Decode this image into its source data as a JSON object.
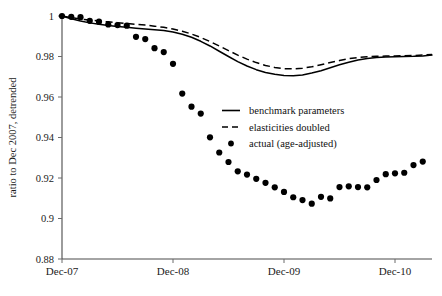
{
  "chart_data": {
    "type": "line",
    "title": "",
    "xlabel": "",
    "ylabel": "ratio to Dec 2007, detrended",
    "ylim": [
      0.88,
      1.0
    ],
    "xlim": [
      0,
      39
    ],
    "grid": false,
    "legend_position": "center-right",
    "y_ticks": [
      {
        "value": 1.0,
        "label": "1"
      },
      {
        "value": 0.98,
        "label": "0.98"
      },
      {
        "value": 0.96,
        "label": "0.96"
      },
      {
        "value": 0.94,
        "label": "0.94"
      },
      {
        "value": 0.92,
        "label": "0.92"
      },
      {
        "value": 0.9,
        "label": "0.9"
      },
      {
        "value": 0.88,
        "label": "0.88"
      }
    ],
    "x_ticks": [
      {
        "value": 0,
        "label": "Dec-07"
      },
      {
        "value": 12,
        "label": "Dec-08"
      },
      {
        "value": 24,
        "label": "Dec-09"
      },
      {
        "value": 36,
        "label": "Dec-10"
      }
    ],
    "series": [
      {
        "name": "benchmark parameters",
        "style": "solid",
        "x": [
          0,
          1,
          2,
          3,
          4,
          5,
          6,
          7,
          8,
          9,
          10,
          11,
          12,
          13,
          14,
          15,
          16,
          17,
          18,
          19,
          20,
          21,
          22,
          23,
          24,
          25,
          26,
          27,
          28,
          29,
          30,
          31,
          32,
          33,
          34,
          35,
          36,
          37,
          38,
          39,
          40
        ],
        "values": [
          1.0,
          0.9986,
          0.9975,
          0.9966,
          0.9959,
          0.9953,
          0.9948,
          0.9944,
          0.994,
          0.9936,
          0.9932,
          0.9928,
          0.9921,
          0.991,
          0.9895,
          0.9875,
          0.9852,
          0.9826,
          0.98,
          0.9775,
          0.9753,
          0.9735,
          0.9721,
          0.9712,
          0.9706,
          0.9705,
          0.9709,
          0.9718,
          0.973,
          0.9744,
          0.9759,
          0.9772,
          0.9783,
          0.979,
          0.9795,
          0.9798,
          0.9799,
          0.98,
          0.9801,
          0.9803,
          0.9807
        ]
      },
      {
        "name": "elasticities doubled",
        "style": "dashed",
        "x": [
          0,
          1,
          2,
          3,
          4,
          5,
          6,
          7,
          8,
          9,
          10,
          11,
          12,
          13,
          14,
          15,
          16,
          17,
          18,
          19,
          20,
          21,
          22,
          23,
          24,
          25,
          26,
          27,
          28,
          29,
          30,
          31,
          32,
          33,
          34,
          35,
          36,
          37,
          38,
          39,
          40
        ],
        "values": [
          1.0,
          0.9992,
          0.9985,
          0.998,
          0.9975,
          0.9971,
          0.9967,
          0.9963,
          0.9959,
          0.9955,
          0.995,
          0.9944,
          0.9936,
          0.9925,
          0.9911,
          0.9894,
          0.9874,
          0.9852,
          0.9829,
          0.9807,
          0.9787,
          0.977,
          0.9756,
          0.9746,
          0.974,
          0.9739,
          0.9742,
          0.9749,
          0.9759,
          0.977,
          0.978,
          0.9789,
          0.9795,
          0.9799,
          0.9801,
          0.9802,
          0.9803,
          0.9804,
          0.9805,
          0.9807,
          0.981
        ]
      },
      {
        "name": "actual (age-adjusted)",
        "style": "dots",
        "x": [
          0,
          1,
          2,
          3,
          4,
          5,
          6,
          7,
          8,
          9,
          10,
          11,
          12,
          13,
          14,
          15,
          16,
          17,
          18,
          19,
          20,
          21,
          22,
          23,
          24,
          25,
          26,
          27,
          28,
          29,
          30,
          31,
          32,
          33,
          34,
          35,
          36,
          37,
          38,
          39
        ],
        "values": [
          1.0,
          0.9996,
          0.9994,
          0.9976,
          0.9972,
          0.9958,
          0.9955,
          0.9952,
          0.9897,
          0.9886,
          0.9841,
          0.9822,
          0.9764,
          0.9617,
          0.9552,
          0.9518,
          0.9401,
          0.9326,
          0.9279,
          0.9233,
          0.9217,
          0.9196,
          0.9176,
          0.9154,
          0.9131,
          0.9105,
          0.9091,
          0.9073,
          0.9107,
          0.9099,
          0.9155,
          0.9159,
          0.9155,
          0.9154,
          0.919,
          0.9219,
          0.9223,
          0.9226,
          0.9264,
          0.9281
        ]
      }
    ],
    "extra_points": {
      "x": [
        29,
        30,
        31,
        32,
        33,
        34,
        35,
        36,
        37,
        38,
        39
      ],
      "values": [
        0.9103,
        0.9152,
        0.9159,
        0.9157,
        0.9152,
        0.9191,
        0.922,
        0.9224,
        0.9226,
        0.9262,
        0.9282
      ]
    }
  },
  "legend": {
    "items": [
      {
        "label": "benchmark parameters",
        "marker": "solid-line"
      },
      {
        "label": "elasticities doubled",
        "marker": "dashed-line"
      },
      {
        "label": "actual (age-adjusted)",
        "marker": "filled-circle"
      }
    ]
  }
}
